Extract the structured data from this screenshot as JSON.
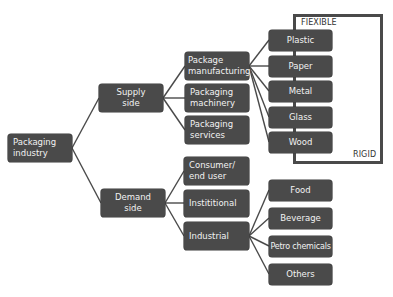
{
  "diagram": {
    "type": "tree",
    "root": {
      "label": "Packaging industry"
    },
    "level1": [
      {
        "label": "Supply side"
      },
      {
        "label": "Demand side"
      }
    ],
    "supply_children": [
      {
        "label": "Package manufacturing"
      },
      {
        "label": "Packaging machinery"
      },
      {
        "label": "Packaging services"
      }
    ],
    "materials": [
      {
        "label": "Plastic"
      },
      {
        "label": "Paper"
      },
      {
        "label": "Metal"
      },
      {
        "label": "Glass"
      },
      {
        "label": "Wood"
      }
    ],
    "material_scale": {
      "top_label": "FIEXIBLE",
      "bottom_label": "RIGID"
    },
    "demand_children": [
      {
        "label": "Consumer/ end user"
      },
      {
        "label": "Instititional"
      },
      {
        "label": "Industrial"
      }
    ],
    "industrial_children": [
      {
        "label": "Food"
      },
      {
        "label": "Beverage"
      },
      {
        "label": "Petro chemicals"
      },
      {
        "label": "Others"
      }
    ],
    "colors": {
      "node_fill": "#4a4a4a",
      "node_text": "#f2f2f2",
      "line": "#4a4a4a",
      "background": "#ffffff"
    }
  }
}
